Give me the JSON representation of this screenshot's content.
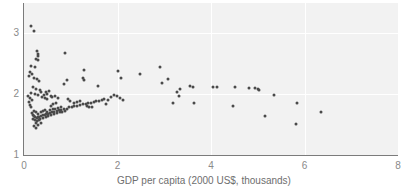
{
  "chart_data": {
    "type": "scatter",
    "title": "",
    "xlabel": "GDP per capita (2000 US$, thousands)",
    "ylabel": "",
    "xlim": [
      0,
      8
    ],
    "ylim": [
      1,
      3.2
    ],
    "xticks": [
      0,
      2,
      4,
      6,
      8
    ],
    "xtick_labels": [
      "0",
      "2",
      "4",
      "6",
      "8"
    ],
    "yticks": [
      1,
      2,
      3
    ],
    "ytick_labels": [
      "1",
      "2",
      "3"
    ],
    "grid": true,
    "grid_color": "#ffffff",
    "plot_background": "#f2f2f2",
    "marker_color": "#4a4a4a",
    "marker_size": 3,
    "legend": null,
    "points": [
      [
        0.15,
        3.12
      ],
      [
        0.21,
        3.03
      ],
      [
        0.27,
        2.7
      ],
      [
        0.29,
        2.66
      ],
      [
        0.3,
        2.62
      ],
      [
        0.26,
        2.58
      ],
      [
        0.31,
        2.55
      ],
      [
        0.88,
        2.68
      ],
      [
        0.16,
        2.46
      ],
      [
        0.23,
        2.44
      ],
      [
        0.13,
        2.36
      ],
      [
        0.18,
        2.33
      ],
      [
        0.1,
        2.3
      ],
      [
        0.21,
        2.27
      ],
      [
        0.28,
        2.25
      ],
      [
        0.33,
        2.22
      ],
      [
        1.29,
        2.39
      ],
      [
        1.27,
        2.27
      ],
      [
        1.28,
        2.23
      ],
      [
        2.02,
        2.38
      ],
      [
        2.07,
        2.26
      ],
      [
        2.49,
        2.32
      ],
      [
        2.9,
        2.44
      ],
      [
        3.09,
        2.25
      ],
      [
        2.96,
        2.18
      ],
      [
        0.93,
        2.23
      ],
      [
        0.86,
        2.17
      ],
      [
        1.58,
        2.13
      ],
      [
        0.2,
        2.12
      ],
      [
        0.26,
        2.09
      ],
      [
        0.34,
        2.07
      ],
      [
        0.37,
        2.04
      ],
      [
        0.14,
        2.02
      ],
      [
        0.24,
        2.0
      ],
      [
        0.31,
        1.99
      ],
      [
        0.42,
        1.98
      ],
      [
        0.46,
        2.03
      ],
      [
        0.5,
        2.0
      ],
      [
        0.54,
        2.05
      ],
      [
        0.57,
        1.97
      ],
      [
        0.08,
        1.96
      ],
      [
        0.12,
        1.93
      ],
      [
        0.18,
        1.9
      ],
      [
        0.11,
        1.87
      ],
      [
        3.33,
        2.08
      ],
      [
        3.28,
        2.04
      ],
      [
        3.32,
        1.97
      ],
      [
        3.55,
        2.13
      ],
      [
        3.62,
        2.12
      ],
      [
        4.05,
        2.11
      ],
      [
        4.13,
        2.11
      ],
      [
        4.52,
        2.12
      ],
      [
        4.82,
        2.1
      ],
      [
        4.95,
        2.1
      ],
      [
        5.0,
        2.08
      ],
      [
        5.02,
        2.06
      ],
      [
        5.34,
        1.99
      ],
      [
        1.98,
        1.96
      ],
      [
        1.92,
        1.99
      ],
      [
        1.87,
        1.95
      ],
      [
        2.06,
        1.93
      ],
      [
        1.8,
        1.9
      ],
      [
        1.72,
        1.92
      ],
      [
        1.66,
        1.9
      ],
      [
        1.6,
        1.88
      ],
      [
        1.54,
        1.89
      ],
      [
        1.49,
        1.87
      ],
      [
        1.43,
        1.86
      ],
      [
        1.37,
        1.85
      ],
      [
        1.32,
        1.83
      ],
      [
        1.26,
        1.84
      ],
      [
        1.2,
        1.82
      ],
      [
        1.14,
        1.81
      ],
      [
        1.08,
        1.8
      ],
      [
        1.02,
        1.79
      ],
      [
        0.97,
        1.78
      ],
      [
        0.91,
        1.76
      ],
      [
        0.86,
        1.75
      ],
      [
        0.8,
        1.74
      ],
      [
        0.75,
        1.73
      ],
      [
        0.7,
        1.72
      ],
      [
        0.65,
        1.71
      ],
      [
        0.6,
        1.7
      ],
      [
        0.56,
        1.69
      ],
      [
        0.52,
        1.68
      ],
      [
        0.48,
        1.67
      ],
      [
        0.44,
        1.66
      ],
      [
        0.4,
        1.65
      ],
      [
        0.36,
        1.64
      ],
      [
        0.33,
        1.63
      ],
      [
        0.3,
        1.62
      ],
      [
        0.27,
        1.61
      ],
      [
        0.24,
        1.62
      ],
      [
        0.21,
        1.64
      ],
      [
        0.19,
        1.66
      ],
      [
        0.17,
        1.69
      ],
      [
        0.22,
        1.72
      ],
      [
        0.26,
        1.7
      ],
      [
        0.31,
        1.68
      ],
      [
        0.36,
        1.7
      ],
      [
        0.41,
        1.72
      ],
      [
        0.45,
        1.74
      ],
      [
        0.5,
        1.71
      ],
      [
        0.55,
        1.73
      ],
      [
        0.61,
        1.75
      ],
      [
        0.67,
        1.76
      ],
      [
        0.73,
        1.77
      ],
      [
        0.79,
        1.78
      ],
      [
        0.28,
        1.55
      ],
      [
        0.33,
        1.57
      ],
      [
        0.25,
        1.52
      ],
      [
        0.3,
        1.5
      ],
      [
        0.36,
        1.53
      ],
      [
        0.23,
        1.58
      ],
      [
        0.63,
        1.83
      ],
      [
        0.68,
        1.85
      ],
      [
        0.58,
        1.8
      ],
      [
        0.94,
        1.92
      ],
      [
        0.99,
        1.88
      ],
      [
        3.19,
        1.85
      ],
      [
        3.63,
        1.85
      ],
      [
        4.47,
        1.8
      ],
      [
        5.16,
        1.64
      ],
      [
        5.83,
        1.86
      ],
      [
        5.82,
        1.51
      ],
      [
        6.35,
        1.71
      ],
      [
        0.44,
        1.93
      ],
      [
        0.49,
        1.91
      ],
      [
        0.39,
        1.95
      ],
      [
        0.6,
        1.95
      ],
      [
        0.66,
        1.97
      ],
      [
        0.72,
        1.93
      ],
      [
        1.34,
        1.8
      ],
      [
        1.4,
        1.78
      ],
      [
        1.46,
        1.79
      ],
      [
        1.07,
        1.86
      ],
      [
        1.13,
        1.87
      ],
      [
        1.19,
        1.88
      ],
      [
        0.15,
        1.78
      ],
      [
        0.13,
        1.82
      ],
      [
        0.19,
        1.59
      ],
      [
        0.35,
        1.59
      ],
      [
        2.12,
        1.9
      ],
      [
        1.76,
        1.84
      ],
      [
        0.41,
        1.6
      ],
      [
        0.46,
        1.62
      ],
      [
        0.52,
        1.64
      ],
      [
        0.58,
        1.66
      ],
      [
        0.64,
        1.67
      ],
      [
        0.7,
        1.69
      ],
      [
        0.76,
        1.7
      ],
      [
        0.82,
        1.71
      ],
      [
        0.88,
        1.72
      ],
      [
        0.21,
        1.47
      ],
      [
        0.26,
        1.45
      ]
    ]
  },
  "axis": {
    "x_title": "GDP per capita (2000 US$, thousands)"
  }
}
